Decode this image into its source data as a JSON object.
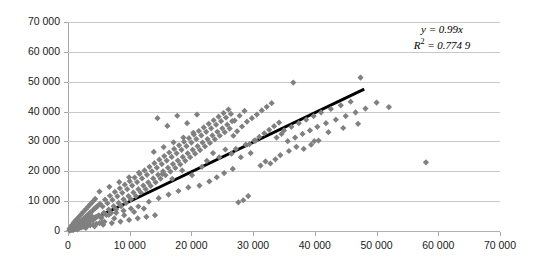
{
  "chart_data": {
    "type": "scatter",
    "title": "",
    "xlabel": "",
    "ylabel": "",
    "xlim": [
      0,
      70000
    ],
    "ylim": [
      0,
      70000
    ],
    "x_ticks": [
      0,
      10000,
      20000,
      30000,
      40000,
      50000,
      60000,
      70000
    ],
    "y_ticks": [
      0,
      10000,
      20000,
      30000,
      40000,
      50000,
      60000,
      70000
    ],
    "x_tick_labels": [
      "0",
      "10 000",
      "20 000",
      "30 000",
      "40 000",
      "50 000",
      "60 000",
      "70 000"
    ],
    "y_tick_labels": [
      "0",
      "10 000",
      "20 000",
      "30 000",
      "40 000",
      "50 000",
      "60 000",
      "70 000"
    ],
    "grid": "horizontal",
    "legend": "none",
    "marker": {
      "shape": "diamond",
      "color": "#808080",
      "size": 5
    },
    "trendline": {
      "type": "linear-through-origin",
      "slope": 0.99,
      "intercept": 0,
      "color": "#000000",
      "width": 3,
      "x_start": 0,
      "x_end": 48000
    },
    "annotations": {
      "equation": "y = 0.99x",
      "r_squared_label": "R",
      "r_squared_exponent": "2",
      "r_squared_value": " = 0.774 9",
      "r_squared_full": "R² = 0.774 9"
    },
    "points": [
      [
        320,
        210
      ],
      [
        450,
        620
      ],
      [
        610,
        390
      ],
      [
        720,
        1150
      ],
      [
        830,
        540
      ],
      [
        950,
        1380
      ],
      [
        1080,
        760
      ],
      [
        1190,
        1620
      ],
      [
        1310,
        980
      ],
      [
        1420,
        2100
      ],
      [
        1530,
        1240
      ],
      [
        1650,
        2480
      ],
      [
        1760,
        1460
      ],
      [
        1880,
        2920
      ],
      [
        1990,
        1710
      ],
      [
        2110,
        3350
      ],
      [
        2220,
        1990
      ],
      [
        2340,
        3740
      ],
      [
        2450,
        2260
      ],
      [
        2570,
        4180
      ],
      [
        2680,
        2530
      ],
      [
        2800,
        4610
      ],
      [
        2910,
        2790
      ],
      [
        3030,
        5050
      ],
      [
        3140,
        3060
      ],
      [
        3260,
        5480
      ],
      [
        3370,
        3320
      ],
      [
        3490,
        5920
      ],
      [
        3600,
        3590
      ],
      [
        3720,
        6350
      ],
      [
        3830,
        3850
      ],
      [
        3950,
        6790
      ],
      [
        4060,
        4120
      ],
      [
        4180,
        7220
      ],
      [
        4290,
        4380
      ],
      [
        4410,
        7660
      ],
      [
        4520,
        4650
      ],
      [
        4640,
        8090
      ],
      [
        4750,
        4910
      ],
      [
        4870,
        8530
      ],
      [
        980,
        2950
      ],
      [
        1360,
        3820
      ],
      [
        1740,
        4680
      ],
      [
        2120,
        5550
      ],
      [
        2500,
        6410
      ],
      [
        2880,
        7280
      ],
      [
        3260,
        8140
      ],
      [
        3640,
        9010
      ],
      [
        4020,
        9870
      ],
      [
        4400,
        10740
      ],
      [
        860,
        410
      ],
      [
        1240,
        820
      ],
      [
        1620,
        1230
      ],
      [
        2000,
        1640
      ],
      [
        2380,
        2050
      ],
      [
        2760,
        2460
      ],
      [
        3140,
        2870
      ],
      [
        3520,
        3280
      ],
      [
        3900,
        3690
      ],
      [
        4280,
        4100
      ],
      [
        5000,
        5200
      ],
      [
        5200,
        9100
      ],
      [
        5400,
        4300
      ],
      [
        5600,
        8200
      ],
      [
        5800,
        6100
      ],
      [
        6000,
        10500
      ],
      [
        6200,
        5400
      ],
      [
        6400,
        9300
      ],
      [
        6600,
        7200
      ],
      [
        6800,
        11800
      ],
      [
        7000,
        6100
      ],
      [
        7200,
        10400
      ],
      [
        7400,
        8300
      ],
      [
        7600,
        13100
      ],
      [
        7800,
        7200
      ],
      [
        8000,
        11600
      ],
      [
        8200,
        9400
      ],
      [
        8400,
        14300
      ],
      [
        8600,
        8300
      ],
      [
        8800,
        12800
      ],
      [
        9000,
        10600
      ],
      [
        9200,
        15500
      ],
      [
        9400,
        9400
      ],
      [
        9600,
        14000
      ],
      [
        9800,
        11700
      ],
      [
        10000,
        16700
      ],
      [
        10200,
        10600
      ],
      [
        10400,
        15200
      ],
      [
        10600,
        12900
      ],
      [
        10800,
        17900
      ],
      [
        11000,
        11700
      ],
      [
        11200,
        16400
      ],
      [
        11400,
        14000
      ],
      [
        11600,
        19100
      ],
      [
        11800,
        12900
      ],
      [
        12000,
        17600
      ],
      [
        12200,
        15200
      ],
      [
        12400,
        20300
      ],
      [
        12600,
        14000
      ],
      [
        12800,
        18800
      ],
      [
        5100,
        13200
      ],
      [
        5900,
        3100
      ],
      [
        6700,
        14800
      ],
      [
        7500,
        4200
      ],
      [
        8300,
        16400
      ],
      [
        9100,
        5300
      ],
      [
        9900,
        18000
      ],
      [
        10700,
        6400
      ],
      [
        11500,
        19600
      ],
      [
        12300,
        7500
      ],
      [
        13000,
        16300
      ],
      [
        13200,
        21500
      ],
      [
        13400,
        15100
      ],
      [
        13600,
        20000
      ],
      [
        13800,
        17600
      ],
      [
        14000,
        22700
      ],
      [
        14200,
        16300
      ],
      [
        14400,
        21200
      ],
      [
        14600,
        18800
      ],
      [
        14800,
        23900
      ],
      [
        15000,
        17500
      ],
      [
        15200,
        22400
      ],
      [
        15400,
        20000
      ],
      [
        15600,
        25100
      ],
      [
        15800,
        18700
      ],
      [
        16000,
        23600
      ],
      [
        16200,
        21200
      ],
      [
        16400,
        26300
      ],
      [
        16600,
        19900
      ],
      [
        16800,
        24800
      ],
      [
        17000,
        22400
      ],
      [
        17200,
        27500
      ],
      [
        17400,
        21100
      ],
      [
        17600,
        26000
      ],
      [
        17800,
        23600
      ],
      [
        18000,
        28700
      ],
      [
        18200,
        22300
      ],
      [
        18400,
        27200
      ],
      [
        18600,
        24800
      ],
      [
        18800,
        29900
      ],
      [
        13100,
        9800
      ],
      [
        13900,
        26500
      ],
      [
        14700,
        11000
      ],
      [
        15500,
        28100
      ],
      [
        16300,
        12200
      ],
      [
        17100,
        29700
      ],
      [
        17900,
        13400
      ],
      [
        18700,
        31300
      ],
      [
        19500,
        14600
      ],
      [
        20300,
        32900
      ],
      [
        19000,
        23500
      ],
      [
        19200,
        28400
      ],
      [
        19400,
        26000
      ],
      [
        19600,
        31100
      ],
      [
        19800,
        24700
      ],
      [
        20000,
        29600
      ],
      [
        20200,
        27200
      ],
      [
        20400,
        32300
      ],
      [
        20600,
        25900
      ],
      [
        20800,
        30800
      ],
      [
        21000,
        28400
      ],
      [
        21200,
        33500
      ],
      [
        21400,
        27100
      ],
      [
        21600,
        32000
      ],
      [
        21800,
        29600
      ],
      [
        22000,
        34700
      ],
      [
        22200,
        28300
      ],
      [
        22400,
        33200
      ],
      [
        22600,
        30800
      ],
      [
        22800,
        35900
      ],
      [
        23000,
        29500
      ],
      [
        23200,
        34400
      ],
      [
        23400,
        32000
      ],
      [
        23600,
        37100
      ],
      [
        23800,
        30700
      ],
      [
        14500,
        37800
      ],
      [
        16100,
        35200
      ],
      [
        17700,
        38600
      ],
      [
        19300,
        36100
      ],
      [
        20900,
        39000
      ],
      [
        15300,
        19100
      ],
      [
        16900,
        17500
      ],
      [
        18500,
        20300
      ],
      [
        20100,
        18700
      ],
      [
        21700,
        21500
      ],
      [
        24000,
        35600
      ],
      [
        24200,
        33200
      ],
      [
        24400,
        38300
      ],
      [
        24600,
        31900
      ],
      [
        24800,
        36800
      ],
      [
        25000,
        34400
      ],
      [
        25200,
        39500
      ],
      [
        25400,
        33100
      ],
      [
        25600,
        38000
      ],
      [
        25800,
        35600
      ],
      [
        26000,
        40700
      ],
      [
        26200,
        34300
      ],
      [
        26400,
        39200
      ],
      [
        26600,
        36800
      ],
      [
        26800,
        31900
      ],
      [
        22500,
        23500
      ],
      [
        23500,
        26100
      ],
      [
        24500,
        24700
      ],
      [
        25500,
        27300
      ],
      [
        26500,
        25900
      ],
      [
        21300,
        15200
      ],
      [
        22900,
        16600
      ],
      [
        24100,
        18000
      ],
      [
        25300,
        19400
      ],
      [
        26700,
        20800
      ],
      [
        27000,
        37000
      ],
      [
        27400,
        33400
      ],
      [
        27800,
        38600
      ],
      [
        28200,
        35000
      ],
      [
        28600,
        40200
      ],
      [
        29000,
        36600
      ],
      [
        29400,
        29100
      ],
      [
        29800,
        37800
      ],
      [
        30200,
        30300
      ],
      [
        30600,
        39000
      ],
      [
        27200,
        27500
      ],
      [
        28000,
        24700
      ],
      [
        28800,
        28900
      ],
      [
        29600,
        26100
      ],
      [
        30400,
        30300
      ],
      [
        28400,
        10300
      ],
      [
        29200,
        11700
      ],
      [
        27600,
        9600
      ],
      [
        31000,
        31500
      ],
      [
        31400,
        40400
      ],
      [
        31800,
        32700
      ],
      [
        32200,
        41600
      ],
      [
        32600,
        33900
      ],
      [
        33000,
        42800
      ],
      [
        33400,
        35100
      ],
      [
        33800,
        31300
      ],
      [
        34200,
        36300
      ],
      [
        34600,
        32500
      ],
      [
        31200,
        21900
      ],
      [
        32000,
        23300
      ],
      [
        32800,
        22600
      ],
      [
        33600,
        24000
      ],
      [
        34400,
        25400
      ],
      [
        35000,
        33700
      ],
      [
        35600,
        30100
      ],
      [
        36200,
        34900
      ],
      [
        36800,
        31300
      ],
      [
        37400,
        36100
      ],
      [
        38000,
        32500
      ],
      [
        38600,
        37300
      ],
      [
        39200,
        33700
      ],
      [
        39800,
        38500
      ],
      [
        40400,
        34900
      ],
      [
        35800,
        26800
      ],
      [
        37000,
        28200
      ],
      [
        38200,
        27500
      ],
      [
        39400,
        28900
      ],
      [
        40600,
        30300
      ],
      [
        36500,
        49700
      ],
      [
        39900,
        30100
      ],
      [
        41000,
        39700
      ],
      [
        41800,
        36100
      ],
      [
        42600,
        40900
      ],
      [
        43400,
        37300
      ],
      [
        44200,
        42100
      ],
      [
        45000,
        38500
      ],
      [
        45800,
        43300
      ],
      [
        46600,
        39700
      ],
      [
        47400,
        51400
      ],
      [
        48200,
        41000
      ],
      [
        42200,
        33100
      ],
      [
        44600,
        34500
      ],
      [
        47000,
        35900
      ],
      [
        50000,
        43000
      ],
      [
        52000,
        41500
      ],
      [
        58000,
        23000
      ],
      [
        1500,
        520
      ],
      [
        2900,
        1050
      ],
      [
        4300,
        1580
      ],
      [
        5700,
        2110
      ],
      [
        7100,
        2640
      ],
      [
        8500,
        3170
      ],
      [
        9900,
        3700
      ],
      [
        11300,
        4230
      ],
      [
        12700,
        4760
      ],
      [
        14100,
        5290
      ],
      [
        600,
        1900
      ],
      [
        1800,
        2600
      ],
      [
        3000,
        3300
      ],
      [
        4200,
        4000
      ],
      [
        5400,
        4700
      ],
      [
        6600,
        5400
      ],
      [
        7800,
        6100
      ],
      [
        9000,
        6800
      ],
      [
        10200,
        7500
      ],
      [
        11400,
        8200
      ],
      [
        200,
        150
      ],
      [
        400,
        300
      ],
      [
        700,
        450
      ],
      [
        1000,
        600
      ],
      [
        1300,
        750
      ],
      [
        1600,
        900
      ],
      [
        1900,
        1050
      ],
      [
        2200,
        1200
      ],
      [
        2600,
        1400
      ],
      [
        3100,
        1650
      ],
      [
        3600,
        1900
      ],
      [
        4100,
        2150
      ],
      [
        4600,
        2400
      ],
      [
        5100,
        2650
      ],
      [
        5600,
        2900
      ],
      [
        250,
        800
      ],
      [
        550,
        1400
      ],
      [
        900,
        2000
      ],
      [
        1250,
        2300
      ],
      [
        1700,
        2800
      ],
      [
        2150,
        3200
      ],
      [
        2600,
        3600
      ],
      [
        3050,
        4000
      ],
      [
        3500,
        4400
      ],
      [
        3950,
        4800
      ]
    ]
  }
}
